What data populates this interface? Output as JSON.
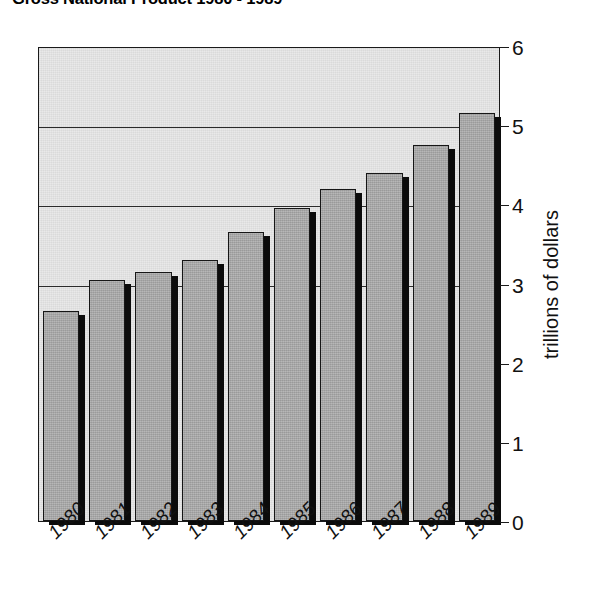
{
  "chart_data": {
    "type": "bar",
    "title": "Gross National Product  1980 - 1989",
    "xlabel": "",
    "ylabel": "trillions of dollars",
    "categories": [
      "1980",
      "1981",
      "1982",
      "1983",
      "1984",
      "1985",
      "1986",
      "1987",
      "1988",
      "1989"
    ],
    "values": [
      2.65,
      3.05,
      3.15,
      3.3,
      3.65,
      3.95,
      4.2,
      4.4,
      4.75,
      5.15
    ],
    "ylim": [
      0,
      6
    ],
    "ytick_labels": [
      "0",
      "1",
      "2",
      "3",
      "4",
      "5",
      "6"
    ],
    "ytick_values": [
      0,
      1,
      2,
      3,
      4,
      5,
      6
    ],
    "gridlines": [
      3,
      4,
      5
    ],
    "grid": true,
    "legend": null,
    "legend_position": "none",
    "y_axis_side": "right",
    "x_tick_rotation": -45,
    "style": {
      "bar_fill": "#a9a9a9",
      "bar_border": "#161616",
      "bar_shadow": "#0b0b0b",
      "plot_background": "#e9e9e9",
      "page_background": "#ffffff",
      "text_color": "#111111",
      "axis_color": "#1a1a1a"
    }
  }
}
